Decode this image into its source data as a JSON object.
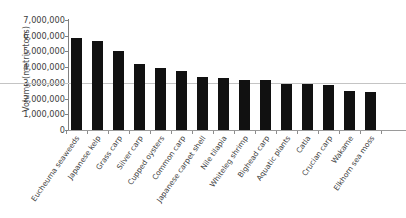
{
  "chart_data": {
    "type": "bar",
    "title": "",
    "xlabel": "",
    "ylabel": "Volume (metric tons)",
    "ylim": [
      0,
      7000000
    ],
    "ytick_labels": [
      "7,000,000",
      "6,000,000",
      "5,000,000",
      "4,000,000",
      "3,000,000",
      "2,000,000",
      "1,000,000",
      "0"
    ],
    "ytick_values": [
      7000000,
      6000000,
      5000000,
      4000000,
      3000000,
      2000000,
      1000000,
      0
    ],
    "grid": "single horizontal rule at 3,000,000 spanning full width",
    "legend": "none",
    "bar_color": "#111111",
    "categories": [
      "Eucheuma seaweeds",
      "Japanese kelp",
      "Grass carp",
      "Silver carp",
      "Cupped oysters",
      "Common carp",
      "Japanese carpet shell",
      "Nile tilapia",
      "Whiteleg shrimp",
      "Bighead carp",
      "Aquatic plants",
      "Catla",
      "Crucian carp",
      "Wakame",
      "Elkhorn sea moss"
    ],
    "values": [
      5850000,
      5650000,
      5050000,
      4200000,
      3970000,
      3780000,
      3350000,
      3300000,
      3200000,
      3200000,
      2950000,
      2900000,
      2850000,
      2500000,
      2400000
    ]
  }
}
